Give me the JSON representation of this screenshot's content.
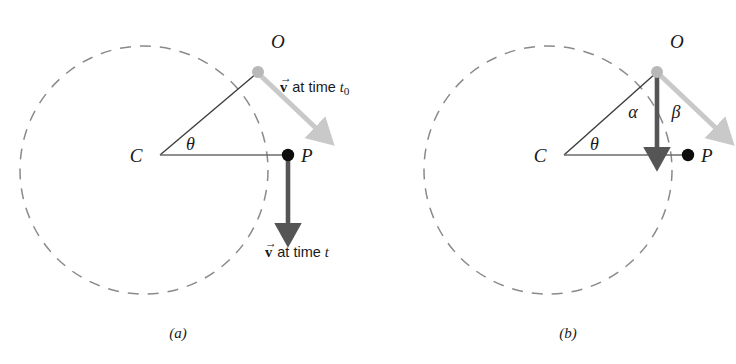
{
  "figure": {
    "type": "physics-diagram",
    "background_color": "#ffffff"
  },
  "colors": {
    "dashed_circle": "#8a8a8a",
    "solid_line": "#6b6b6b",
    "radius_line": "#3c3c3c",
    "dark_arrow": "#555555",
    "light_arrow": "#c9c9c9",
    "point_dark": "#0d0d0d",
    "point_light": "#b8b8b8",
    "text": "#1a1a1a"
  },
  "panels": [
    {
      "id": "a",
      "caption": "(a)",
      "points": [
        {
          "name": "C",
          "label": "C",
          "marker": "none"
        },
        {
          "name": "O",
          "label": "O",
          "marker": "light-dot"
        },
        {
          "name": "P",
          "label": "P",
          "marker": "dark-dot"
        }
      ],
      "angles": [
        {
          "name": "theta",
          "label": "θ",
          "at": "C"
        }
      ],
      "vectors": [
        {
          "name": "velocity-at-t0",
          "style": "light",
          "anchor": "O",
          "direction": "tangent-down-right",
          "label": {
            "symbol": "v",
            "text": " at time ",
            "variable": "t",
            "subscript": "0"
          }
        },
        {
          "name": "velocity-at-t",
          "style": "dark",
          "anchor": "P",
          "direction": "straight-down",
          "label": {
            "symbol": "v",
            "text": " at time ",
            "variable": "t",
            "subscript": ""
          }
        }
      ]
    },
    {
      "id": "b",
      "caption": "(b)",
      "points": [
        {
          "name": "C",
          "label": "C",
          "marker": "none"
        },
        {
          "name": "O",
          "label": "O",
          "marker": "light-dot"
        },
        {
          "name": "P",
          "label": "P",
          "marker": "dark-dot"
        }
      ],
      "angles": [
        {
          "name": "theta",
          "label": "θ",
          "at": "C"
        },
        {
          "name": "alpha",
          "label": "α",
          "at": "O",
          "side": "left"
        },
        {
          "name": "beta",
          "label": "β",
          "at": "O",
          "side": "right"
        }
      ],
      "vectors": [
        {
          "name": "velocity-at-t0",
          "style": "light",
          "anchor": "O",
          "direction": "tangent-down-right",
          "label": null
        },
        {
          "name": "velocity-at-t-translated",
          "style": "dark",
          "anchor": "O",
          "direction": "straight-down",
          "label": null
        }
      ]
    }
  ]
}
